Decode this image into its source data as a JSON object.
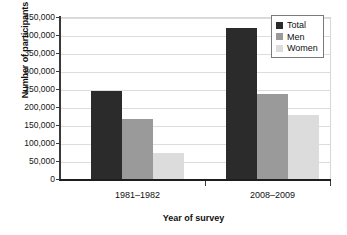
{
  "chart_data": {
    "type": "bar",
    "title": "",
    "xlabel": "Year of survey",
    "ylabel": "Number of participants",
    "categories": [
      "1981–1982",
      "2008–2009"
    ],
    "series": [
      {
        "name": "Total",
        "values": [
          245000,
          420000
        ],
        "color": "#2b2b2b"
      },
      {
        "name": "Men",
        "values": [
          167000,
          237000
        ],
        "color": "#9a9a9a"
      },
      {
        "name": "Women",
        "values": [
          72000,
          178000
        ],
        "color": "#dcdcdc"
      }
    ],
    "ylim": [
      0,
      450000
    ],
    "ytick_step": 50000,
    "ytick_labels": [
      "450,000",
      "400,000",
      "350,000",
      "300,000",
      "250,000",
      "200,000",
      "150,000",
      "100,000",
      "50,000",
      "0"
    ],
    "ytick_values": [
      450000,
      400000,
      350000,
      300000,
      250000,
      200000,
      150000,
      100000,
      50000,
      0
    ],
    "grid": true,
    "legend_position": "top-right",
    "legend_entries": [
      "Total",
      "Men",
      "Women"
    ]
  },
  "colors": {
    "total": "#2b2b2b",
    "men": "#9a9a9a",
    "women": "#dcdcdc",
    "axis": "#1e1e1e",
    "grid": "#dddddd",
    "background": "#ffffff"
  }
}
